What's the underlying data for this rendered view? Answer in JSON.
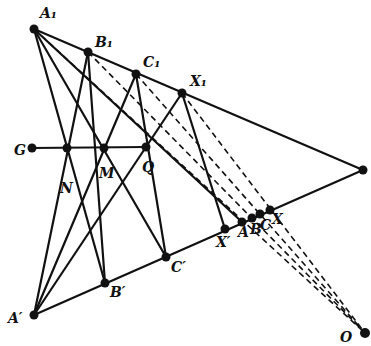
{
  "diagram": {
    "points": {
      "A1": {
        "label": "A₁",
        "x": 34,
        "y": 29,
        "lx": 40,
        "ly": 18
      },
      "B1": {
        "label": "B₁",
        "x": 88,
        "y": 52,
        "lx": 95,
        "ly": 47
      },
      "C1": {
        "label": "C₁",
        "x": 136,
        "y": 74,
        "lx": 143,
        "ly": 67
      },
      "X1": {
        "label": "X₁",
        "x": 182,
        "y": 93,
        "lx": 190,
        "ly": 86
      },
      "P": {
        "label": "",
        "x": 363,
        "y": 170
      },
      "G": {
        "label": "G",
        "x": 32,
        "y": 148,
        "lx": 14,
        "ly": 155
      },
      "N": {
        "label": "N",
        "x": 67,
        "y": 148,
        "lx": 60,
        "ly": 193
      },
      "M": {
        "label": "M",
        "x": 104,
        "y": 148,
        "lx": 99,
        "ly": 178
      },
      "Q": {
        "label": "Q",
        "x": 146,
        "y": 147,
        "lx": 142,
        "ly": 172
      },
      "A_prime": {
        "label": "A′",
        "x": 34,
        "y": 315,
        "lx": 8,
        "ly": 323
      },
      "B_prime": {
        "label": "B′",
        "x": 105,
        "y": 283,
        "lx": 110,
        "ly": 297
      },
      "C_prime": {
        "label": "C′",
        "x": 166,
        "y": 257,
        "lx": 171,
        "ly": 272
      },
      "X_prime": {
        "label": "X′",
        "x": 225,
        "y": 229,
        "lx": 216,
        "ly": 247
      },
      "A": {
        "label": "A",
        "x": 242,
        "y": 222,
        "lx": 238,
        "ly": 237
      },
      "B": {
        "label": "B",
        "x": 252,
        "y": 218,
        "lx": 250,
        "ly": 234
      },
      "C": {
        "label": "C",
        "x": 260,
        "y": 214,
        "lx": 260,
        "ly": 230
      },
      "X": {
        "label": "X",
        "x": 270,
        "y": 210,
        "lx": 272,
        "ly": 224
      },
      "O": {
        "label": "O",
        "x": 365,
        "y": 333,
        "lx": 340,
        "ly": 342
      }
    },
    "solid_lines": [
      [
        "A1",
        "P"
      ],
      [
        "A_prime",
        "P"
      ],
      [
        "G",
        "Q"
      ],
      [
        "A1",
        "B_prime"
      ],
      [
        "A1",
        "C_prime"
      ],
      [
        "A1",
        "A"
      ],
      [
        "A_prime",
        "B1"
      ],
      [
        "A_prime",
        "C1"
      ],
      [
        "A_prime",
        "X1"
      ],
      [
        "B1",
        "B_prime"
      ],
      [
        "C1",
        "C_prime"
      ],
      [
        "X1",
        "X_prime"
      ]
    ],
    "dashed_lines": [
      [
        "A1",
        "O"
      ],
      [
        "B1",
        "O"
      ],
      [
        "C1",
        "O"
      ],
      [
        "X1",
        "O"
      ]
    ],
    "colors": {
      "ink": "#111111",
      "background": "#ffffff"
    }
  }
}
